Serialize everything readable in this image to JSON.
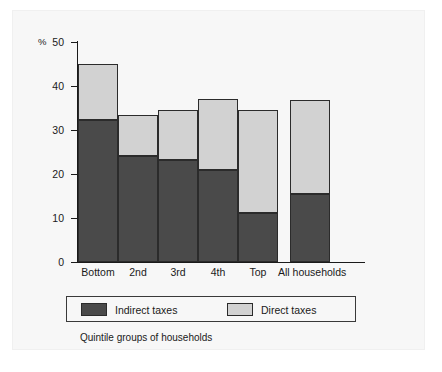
{
  "chart_data": {
    "type": "bar",
    "stacked": true,
    "title": "",
    "subtitle": "",
    "xlabel": "Quintile groups of households",
    "ylabel": "%",
    "ylim": [
      0,
      50
    ],
    "yticks": [
      0,
      10,
      20,
      30,
      40,
      50
    ],
    "grid": false,
    "legend_position": "bottom",
    "categories": [
      "Bottom",
      "2nd",
      "3rd",
      "4th",
      "Top",
      "All households"
    ],
    "series": [
      {
        "name": "Indirect taxes",
        "color": "#4a4a4a",
        "values": [
          32.3,
          24.1,
          23.2,
          20.9,
          11.1,
          15.4
        ]
      },
      {
        "name": "Direct taxes",
        "color": "#d2d2d2",
        "values": [
          12.6,
          9.3,
          11.3,
          16.2,
          23.4,
          21.4
        ]
      }
    ],
    "totals": [
      44.9,
      33.4,
      34.5,
      37.1,
      34.5,
      36.8
    ]
  },
  "axis": {
    "y_unit_label": "%",
    "tick_labels": [
      "50",
      "40",
      "30",
      "20",
      "10",
      "0"
    ]
  },
  "legend": {
    "entries": [
      {
        "label": "Indirect taxes",
        "swatch": "#4a4a4a"
      },
      {
        "label": "Direct taxes",
        "swatch": "#d2d2d2"
      }
    ]
  },
  "caption": {
    "text": "Quintile groups of households"
  }
}
